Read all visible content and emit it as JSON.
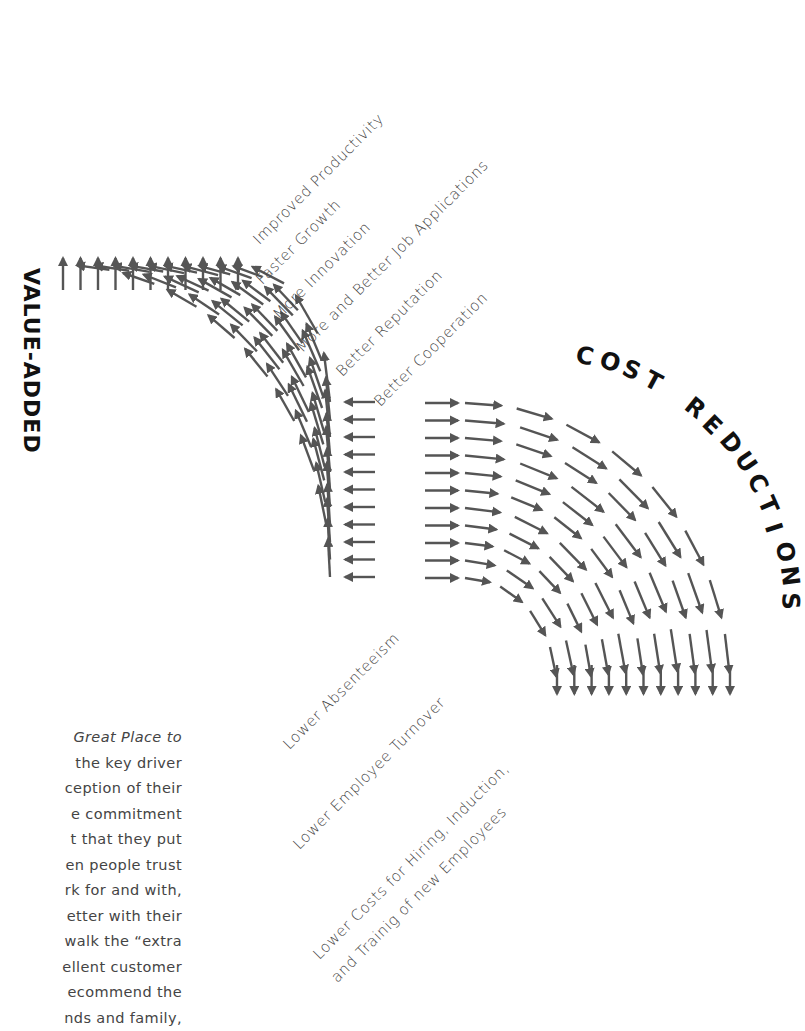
{
  "diagram": {
    "arrow_color": "#555555",
    "value_added": {
      "title": "VALUE-ADDED",
      "labels": [
        "Improved Productivity",
        "Faster Growth",
        "More Innovation",
        "More and Better Job Applications",
        "Better Reputation",
        "Better Cooperation"
      ]
    },
    "cost_reductions": {
      "title": "COST REDUCTIONS",
      "labels": [
        "Lower Absenteeism",
        "Lower Employee Turnover",
        "Lower Costs for Hiring, Induction,",
        "and Trainig of new Employees"
      ]
    }
  },
  "body_text": {
    "lines": [
      "Great Place to",
      "the key driver",
      "ception of their",
      "e commitment",
      "t that they put",
      "en people trust",
      "rk for and with,",
      "etter with their",
      "walk the “extra",
      "ellent customer",
      "ecommend the",
      "nds and family,"
    ]
  }
}
